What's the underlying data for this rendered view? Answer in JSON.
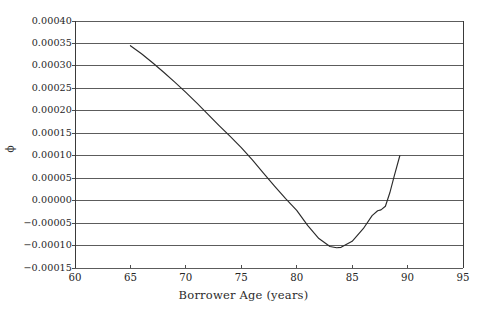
{
  "chart_data": {
    "type": "line",
    "title": "",
    "xlabel": "Borrower Age (years)",
    "ylabel": "ϕ",
    "xlim": [
      60,
      95
    ],
    "ylim": [
      -0.00015,
      0.0004
    ],
    "grid": "horizontal",
    "legend": "none",
    "x_ticks": [
      "60",
      "65",
      "70",
      "75",
      "80",
      "85",
      "90",
      "95"
    ],
    "x_tick_values": [
      60,
      65,
      70,
      75,
      80,
      85,
      90,
      95
    ],
    "y_ticks": [
      "0.00040",
      "0.00035",
      "0.00030",
      "0.00025",
      "0.00020",
      "0.00015",
      "0.00010",
      "0.00005",
      "0.00000",
      "−0.00005",
      "−0.00010",
      "−0.00015"
    ],
    "y_tick_values": [
      0.0004,
      0.00035,
      0.0003,
      0.00025,
      0.0002,
      0.00015,
      0.0001,
      5e-05,
      0.0,
      -5e-05,
      -0.0001,
      -0.00015
    ],
    "series": [
      {
        "name": "phi",
        "x": [
          65.0,
          66.0,
          67.0,
          68.0,
          69.0,
          70.0,
          71.0,
          72.0,
          73.0,
          74.0,
          75.0,
          76.0,
          77.0,
          78.0,
          79.0,
          80.0,
          81.0,
          82.0,
          83.0,
          83.6,
          84.0,
          85.0,
          86.0,
          86.8,
          87.3,
          87.6,
          88.0,
          88.4,
          88.8,
          89.3
        ],
        "y": [
          0.000345,
          0.000327,
          0.000307,
          0.000286,
          0.000264,
          0.000241,
          0.000217,
          0.000192,
          0.000167,
          0.000143,
          0.000118,
          9.05e-05,
          6.15e-05,
          3.25e-05,
          4.5e-06,
          -2.15e-05,
          -5.55e-05,
          -8.45e-05,
          -0.000102,
          -0.000105,
          -0.000104,
          -9.05e-05,
          -6.25e-05,
          -3.35e-05,
          -2.25e-05,
          -2.05e-05,
          -1.25e-05,
          1.75e-05,
          5.5e-05,
          0.0001
        ]
      }
    ],
    "colors": {
      "line": "#2b2b2b",
      "grid": "#4a4a4a",
      "frame": "#3a3a3a",
      "background": "#ffffff",
      "text": "#262626"
    }
  },
  "plot_geometry": {
    "left": 75,
    "right": 463,
    "top": 21,
    "bottom": 268
  }
}
